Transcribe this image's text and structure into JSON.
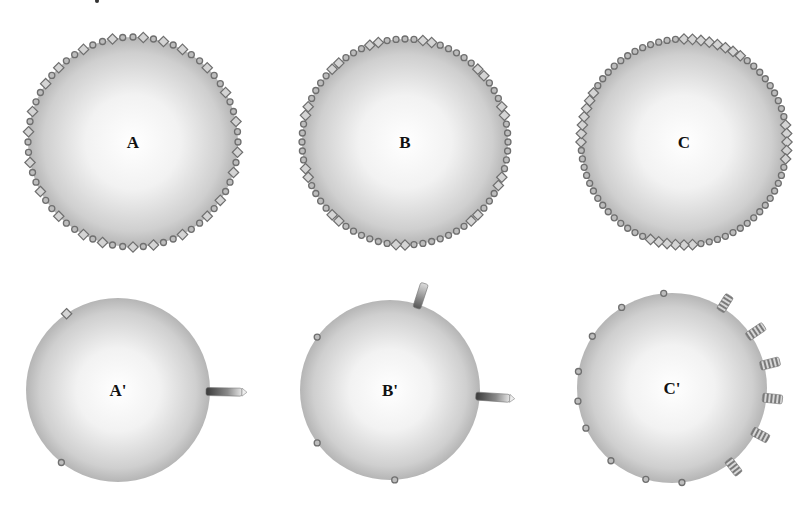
{
  "figure": {
    "width": 809,
    "height": 512,
    "colors": {
      "background": "#ffffff",
      "cell_center": "#ffffff",
      "cell_edge": "#b8b8b8",
      "marker_stroke": "#6f6f6f",
      "diamond_fill": "#d4d4d4",
      "circle_fill": "#bdbdbd",
      "protrusion_dark": "#4a4a4a",
      "protrusion_light": "#e0e0e0"
    },
    "panels": [
      {
        "id": "A",
        "label": "A",
        "row": "top",
        "cx": 133,
        "cy": 142,
        "r": 105,
        "description": "cell with many surface markers (circles and diamonds interleaved)",
        "ring_count": 64,
        "diamond_indices": [
          1,
          3,
          5,
          8,
          11,
          14,
          17,
          19,
          22,
          24,
          27,
          30,
          32,
          35,
          37,
          40,
          43,
          46,
          49,
          51,
          54,
          56,
          59,
          62
        ]
      },
      {
        "id": "B",
        "label": "B",
        "row": "top",
        "cx": 405,
        "cy": 142,
        "r": 103,
        "description": "cell with surface markers, diamonds in small clusters",
        "ring_count": 72,
        "diamond_indices": [
          2,
          3,
          9,
          10,
          14,
          15,
          22,
          23,
          27,
          28,
          36,
          37,
          44,
          45,
          50,
          51,
          57,
          58,
          63,
          64,
          68,
          69
        ]
      },
      {
        "id": "C",
        "label": "C",
        "row": "top",
        "cx": 684,
        "cy": 142,
        "r": 103,
        "description": "cell with surface markers, diamonds grouped in arcs",
        "ring_count": 76,
        "diamond_indices": [
          0,
          1,
          2,
          3,
          4,
          5,
          6,
          7,
          17,
          18,
          19,
          20,
          21,
          37,
          38,
          39,
          40,
          41,
          42,
          57,
          58,
          59,
          60,
          61,
          62,
          63
        ]
      },
      {
        "id": "A'",
        "label": "A'",
        "row": "bottom",
        "cx": 118,
        "cy": 390,
        "r": 92,
        "description": "cell after clustering: one diamond, one small circle, one protrusion",
        "circles": [
          {
            "angle": 128
          }
        ],
        "diamonds": [
          {
            "angle": 236
          }
        ],
        "protrusions": [
          {
            "angle": 1,
            "length": 36,
            "style": "dark"
          }
        ]
      },
      {
        "id": "B'",
        "label": "B'",
        "row": "bottom",
        "cx": 390,
        "cy": 390,
        "r": 90,
        "description": "cell with three small circles and two protrusions",
        "circles": [
          {
            "angle": 216
          },
          {
            "angle": 144
          },
          {
            "angle": 87
          }
        ],
        "diamonds": [],
        "protrusions": [
          {
            "angle": -72,
            "length": 26,
            "style": "light"
          },
          {
            "angle": 4,
            "length": 34,
            "style": "dark"
          }
        ]
      },
      {
        "id": "C'",
        "label": "C'",
        "row": "bottom",
        "cx": 672,
        "cy": 388,
        "r": 95,
        "description": "cell with many small circles on the left and striped protrusions on the right",
        "circles": [
          {
            "angle": 265
          },
          {
            "angle": 238
          },
          {
            "angle": 213
          },
          {
            "angle": 190
          },
          {
            "angle": 172
          },
          {
            "angle": 155
          },
          {
            "angle": 130
          },
          {
            "angle": 106
          },
          {
            "angle": 84
          }
        ],
        "diamonds": [],
        "protrusions": [
          {
            "angle": -58,
            "length": 18,
            "style": "striped"
          },
          {
            "angle": -34,
            "length": 20,
            "style": "striped"
          },
          {
            "angle": -14,
            "length": 20,
            "style": "striped"
          },
          {
            "angle": 6,
            "length": 20,
            "style": "striped"
          },
          {
            "angle": 28,
            "length": 18,
            "style": "striped"
          },
          {
            "angle": 52,
            "length": 18,
            "style": "striped"
          }
        ]
      }
    ]
  }
}
